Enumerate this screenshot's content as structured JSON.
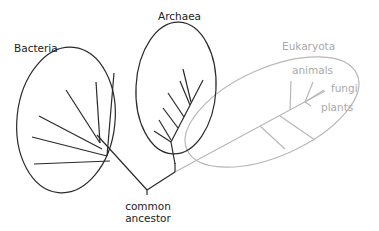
{
  "diagram": {
    "type": "phylogenetic-tree",
    "root": {
      "label": "common ancestor",
      "lines": [
        "common",
        "ancestor"
      ]
    },
    "groups": [
      {
        "id": "bacteria",
        "label": "Bacteria",
        "color": "#222222",
        "branches": 6
      },
      {
        "id": "archaea",
        "label": "Archaea",
        "color": "#222222",
        "branches": 6
      },
      {
        "id": "eukaryota",
        "label": "Eukaryota",
        "color": "#a9a9a9",
        "branches": 5,
        "sublabels": [
          "animals",
          "fungi",
          "plants"
        ]
      }
    ]
  },
  "colors": {
    "dark_line": "#2a2a2a",
    "light_line": "#b5b5b5",
    "background": "#ffffff"
  }
}
